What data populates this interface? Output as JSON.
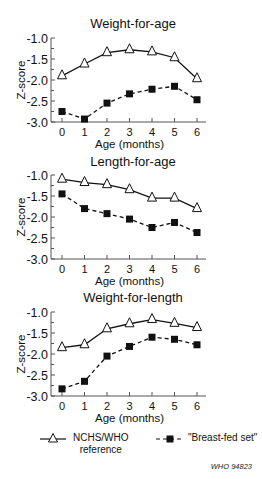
{
  "chart_data": [
    {
      "type": "line",
      "title": "Weight-for-age",
      "xlabel": "Age (months)",
      "ylabel": "Z-score",
      "x": [
        0,
        1,
        2,
        3,
        4,
        5,
        6
      ],
      "ylim": [
        -3.0,
        -1.0
      ],
      "yticks": [
        "-1.0",
        "-1.5",
        "-2.0",
        "-2.5",
        "-3.0"
      ],
      "xticks": [
        "0",
        "1",
        "2",
        "3",
        "4",
        "5",
        "6"
      ],
      "series": [
        {
          "name": "NCHS/WHO reference",
          "values": [
            -1.9,
            -1.62,
            -1.35,
            -1.28,
            -1.33,
            -1.47,
            -1.97
          ]
        },
        {
          "name": "\"Breast-fed set\"",
          "values": [
            -2.75,
            -2.93,
            -2.55,
            -2.33,
            -2.22,
            -2.15,
            -2.47
          ]
        }
      ]
    },
    {
      "type": "line",
      "title": "Length-for-age",
      "xlabel": "Age (months)",
      "ylabel": "Z-score",
      "x": [
        0,
        1,
        2,
        3,
        4,
        5,
        6
      ],
      "ylim": [
        -3.0,
        -1.0
      ],
      "yticks": [
        "-1.0",
        "-1.5",
        "-2.0",
        "-2.5",
        "-3.0"
      ],
      "xticks": [
        "0",
        "1",
        "2",
        "3",
        "4",
        "5",
        "6"
      ],
      "series": [
        {
          "name": "NCHS/WHO reference",
          "values": [
            -1.1,
            -1.18,
            -1.23,
            -1.35,
            -1.55,
            -1.55,
            -1.8
          ]
        },
        {
          "name": "\"Breast-fed set\"",
          "values": [
            -1.45,
            -1.8,
            -1.92,
            -2.05,
            -2.25,
            -2.13,
            -2.37
          ]
        }
      ]
    },
    {
      "type": "line",
      "title": "Weight-for-length",
      "xlabel": "Age (months)",
      "ylabel": "Z-score",
      "x": [
        0,
        1,
        2,
        3,
        4,
        5,
        6
      ],
      "ylim": [
        -3.0,
        -1.0
      ],
      "yticks": [
        "-1.0",
        "-1.5",
        "-2.0",
        "-2.5",
        "-3.0"
      ],
      "xticks": [
        "0",
        "1",
        "2",
        "3",
        "4",
        "5",
        "6"
      ],
      "series": [
        {
          "name": "NCHS/WHO reference",
          "values": [
            -1.85,
            -1.78,
            -1.4,
            -1.28,
            -1.18,
            -1.27,
            -1.37
          ]
        },
        {
          "name": "\"Breast-fed set\"",
          "values": [
            -2.83,
            -2.65,
            -2.05,
            -1.82,
            -1.6,
            -1.65,
            -1.78
          ]
        }
      ]
    }
  ],
  "legend": {
    "reference_label_line1": "NCHS/WHO",
    "reference_label_line2": "reference",
    "breastfed_label": "\"Breast-fed set\""
  },
  "credit": "WHO 94823",
  "colors": {
    "line": "#111111",
    "background": "#ffffff"
  }
}
